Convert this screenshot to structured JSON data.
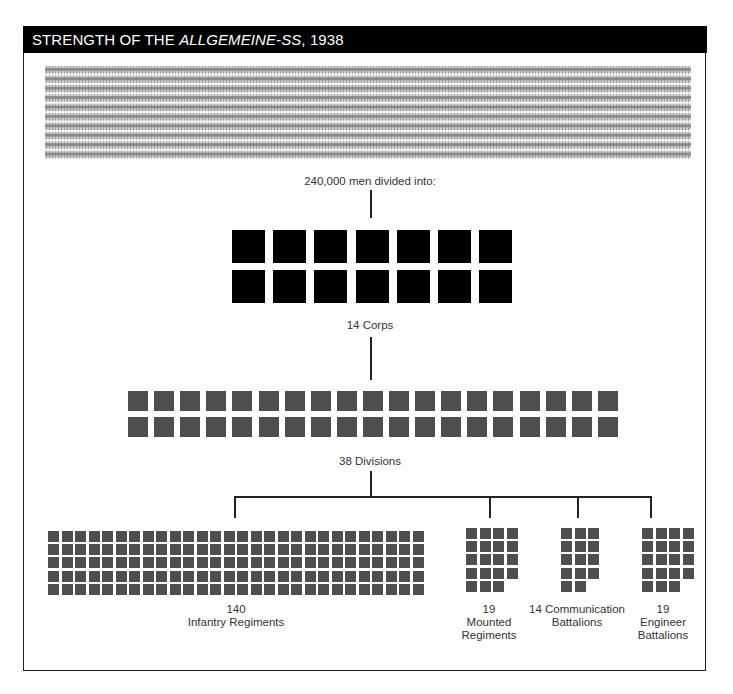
{
  "header": {
    "title_prefix": "STRENGTH OF THE ",
    "title_italic": "ALLGEMEINE-SS",
    "title_suffix": ", 1938"
  },
  "total_label": "240,000 men divided into:",
  "corps": {
    "label": "14 Corps",
    "count": 14,
    "per_row": 7
  },
  "divisions": {
    "label": "38 Divisions",
    "count": 38,
    "per_row": 19
  },
  "units": [
    {
      "id": "infantry",
      "count_label": "140",
      "name_label": "Infantry Regiments",
      "count": 140,
      "cols": 28
    },
    {
      "id": "mounted",
      "count_label": "19",
      "name_label_1": "Mounted",
      "name_label_2": "Regiments",
      "count": 19,
      "cols": 4
    },
    {
      "id": "communication",
      "name_label_1": "14 Communication",
      "name_label_2": "Battalions",
      "count": 14,
      "cols": 3
    },
    {
      "id": "engineer",
      "count_label": "19",
      "name_label_1": "Engineer",
      "name_label_2": "Battalions",
      "count": 19,
      "cols": 4
    }
  ],
  "colors": {
    "header_bg": "#000000",
    "corps": "#000000",
    "units": "#4e4e4e",
    "figures": "#8a8a8a"
  },
  "chart_data": {
    "type": "diagram",
    "title": "Strength of the Allgemeine-SS, 1938",
    "total_men": 240000,
    "hierarchy": [
      {
        "level": "Corps",
        "count": 14
      },
      {
        "level": "Divisions",
        "count": 38
      },
      {
        "level": "Infantry Regiments",
        "count": 140
      },
      {
        "level": "Mounted Regiments",
        "count": 19
      },
      {
        "level": "Communication Battalions",
        "count": 14
      },
      {
        "level": "Engineer Battalions",
        "count": 19
      }
    ]
  }
}
